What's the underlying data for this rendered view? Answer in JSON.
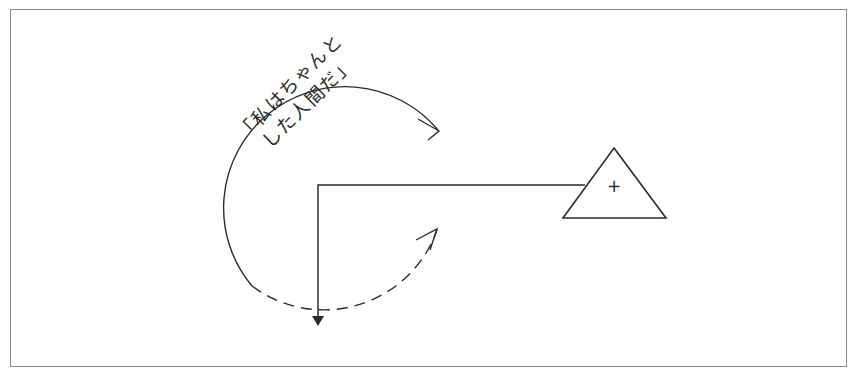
{
  "diagram": {
    "label_line1": "「私はちゃんと",
    "label_line2": "した人間だ」",
    "triangle_symbol": "+",
    "colors": {
      "stroke": "#2a2a2a",
      "frame": "#8a8a8a",
      "background": "#ffffff"
    }
  }
}
